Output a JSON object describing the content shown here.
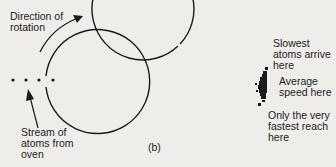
{
  "figure": {
    "panel_label": "(b)",
    "labels": {
      "rotation": "Direction of\nrotation",
      "stream": "Stream of\natoms from\noven",
      "slowest": "Slowest\natoms arrive\nhere",
      "average": "Average\nspeed here",
      "fastest": "Only the very\nfastest reach\nhere"
    },
    "colors": {
      "background": "#eeedea",
      "ink": "#1a1a1a"
    }
  }
}
